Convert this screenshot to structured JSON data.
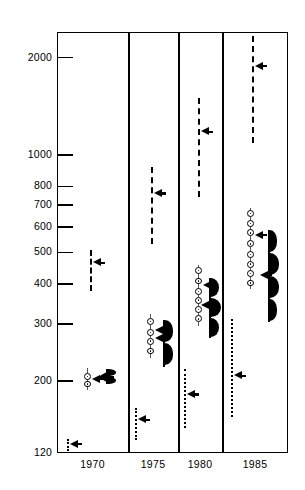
{
  "chart": {
    "type": "dot",
    "title": "",
    "subtitle": "",
    "xlabel": "",
    "ylabel": "",
    "yscale": "log",
    "ylim": [
      120,
      2400
    ],
    "grid": false,
    "legend_position": "none",
    "x_categories": [
      "1970",
      "1975",
      "1980",
      "1985"
    ],
    "y_ticks": [
      {
        "value": 2000,
        "label": "2000"
      },
      {
        "value": 1000,
        "label": "1000"
      },
      {
        "value": 800,
        "label": "800"
      },
      {
        "value": 700,
        "label": "700"
      },
      {
        "value": 600,
        "label": "600"
      },
      {
        "value": 500,
        "label": "500"
      },
      {
        "value": 400,
        "label": "400"
      },
      {
        "value": 300,
        "label": "300"
      },
      {
        "value": 200,
        "label": "200"
      },
      {
        "value": 120,
        "label": "120"
      }
    ]
  },
  "chart_data": {
    "type": "scatter",
    "title": "",
    "xlabel": "",
    "ylabel": "",
    "yscale": "log",
    "ylim": [
      120,
      2400
    ],
    "grid": false,
    "legend_position": "none",
    "categories": [
      "1970",
      "1975",
      "1980",
      "1985"
    ],
    "tick_labels_y": [
      "2000",
      "1000",
      "800",
      "700",
      "600",
      "500",
      "400",
      "300",
      "200",
      "120"
    ],
    "marker_types": {
      "dashed_range": "dashed vertical range bar with left-pointing median pointer",
      "dotted_range": "dotted vertical range bar with left-pointing median pointer",
      "circle_stack": "thin whisker with stacked open circle data points and median pointer",
      "violin": "solid vertical line with filled black density lobes and median pointer"
    },
    "groups": [
      {
        "category": "1970",
        "series": [
          {
            "name": "1970-low-dotted",
            "marker": "dotted_range",
            "low": 122,
            "high": 133,
            "median": 128
          },
          {
            "name": "1970-circles",
            "marker": "circle_stack",
            "low": 193,
            "high": 213,
            "median": 203,
            "points": [
              196,
              207
            ]
          },
          {
            "name": "1970-violin",
            "marker": "violin",
            "low": 196,
            "high": 218,
            "median": 206
          },
          {
            "name": "1970-high-dashed",
            "marker": "dashed_range",
            "low": 380,
            "high": 510,
            "median": 465
          }
        ]
      },
      {
        "category": "1975",
        "series": [
          {
            "name": "1975-low-dotted",
            "marker": "dotted_range",
            "low": 132,
            "high": 165,
            "median": 152
          },
          {
            "name": "1975-circles",
            "marker": "circle_stack",
            "low": 243,
            "high": 313,
            "median": 288,
            "points": [
              248,
              266,
              283,
              306
            ]
          },
          {
            "name": "1975-violin",
            "marker": "violin",
            "low": 222,
            "high": 310,
            "median": 272
          },
          {
            "name": "1975-high-dashed",
            "marker": "dashed_range",
            "low": 530,
            "high": 920,
            "median": 760
          }
        ]
      },
      {
        "category": "1980",
        "series": [
          {
            "name": "1980-low-dotted",
            "marker": "dotted_range",
            "low": 143,
            "high": 218,
            "median": 182
          },
          {
            "name": "1980-circles",
            "marker": "circle_stack",
            "low": 305,
            "high": 443,
            "median": 395,
            "points": [
              312,
              333,
              356,
              379,
              408,
              440
            ]
          },
          {
            "name": "1980-violin",
            "marker": "violin",
            "low": 272,
            "high": 418,
            "median": 343
          },
          {
            "name": "1980-high-dashed",
            "marker": "dashed_range",
            "low": 740,
            "high": 1500,
            "median": 1180
          }
        ]
      },
      {
        "category": "1985",
        "series": [
          {
            "name": "1985-low-dotted",
            "marker": "dotted_range",
            "low": 155,
            "high": 312,
            "median": 208
          },
          {
            "name": "1985-circles",
            "marker": "circle_stack",
            "low": 398,
            "high": 665,
            "median": 565,
            "points": [
              402,
              430,
              460,
              492,
              532,
              575,
              615,
              660
            ]
          },
          {
            "name": "1985-violin",
            "marker": "violin",
            "low": 305,
            "high": 585,
            "median": 425
          },
          {
            "name": "1985-high-dashed",
            "marker": "dashed_range",
            "low": 1090,
            "high": 2330,
            "median": 1880
          }
        ]
      }
    ]
  },
  "layout": {
    "plot_left": 57,
    "plot_top": 32,
    "plot_right": 288,
    "plot_bottom": 453,
    "dividers": [
      128,
      178,
      222
    ]
  }
}
